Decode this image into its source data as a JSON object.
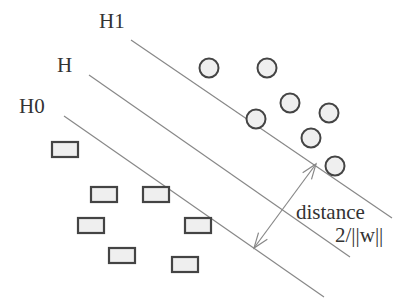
{
  "diagram": {
    "type": "svm-margin",
    "colors": {
      "line": "#888888",
      "shape_stroke": "#444444",
      "shape_fill": "#efefef",
      "text": "#333333"
    },
    "lines": [
      {
        "id": "H1",
        "label": "H1",
        "x1": 131,
        "y1": 40,
        "x2": 392,
        "y2": 218,
        "label_x": 99,
        "label_y": 11
      },
      {
        "id": "H",
        "label": "H",
        "x1": 89,
        "y1": 75,
        "x2": 350,
        "y2": 257,
        "label_x": 57,
        "label_y": 55
      },
      {
        "id": "H0",
        "label": "H0",
        "x1": 64,
        "y1": 116,
        "x2": 324,
        "y2": 297,
        "label_x": 19,
        "label_y": 96
      }
    ],
    "circles": [
      {
        "cx": 209,
        "cy": 68
      },
      {
        "cx": 267,
        "cy": 68
      },
      {
        "cx": 290,
        "cy": 103
      },
      {
        "cx": 256,
        "cy": 119
      },
      {
        "cx": 329,
        "cy": 113
      },
      {
        "cx": 311,
        "cy": 138
      },
      {
        "cx": 335,
        "cy": 166
      }
    ],
    "rects": [
      {
        "x": 52,
        "y": 142
      },
      {
        "x": 91,
        "y": 187
      },
      {
        "x": 143,
        "y": 187
      },
      {
        "x": 78,
        "y": 218
      },
      {
        "x": 185,
        "y": 218
      },
      {
        "x": 109,
        "y": 248
      },
      {
        "x": 172,
        "y": 257
      }
    ],
    "arrow": {
      "x1": 254,
      "y1": 248,
      "x2": 316,
      "y2": 164
    },
    "annotation": {
      "line1": "distance",
      "line2": "2/||w||"
    }
  }
}
